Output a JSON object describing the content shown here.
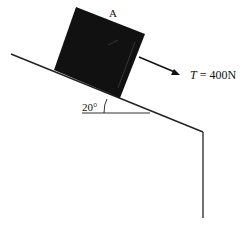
{
  "diagram": {
    "type": "inclined-plane-free-body",
    "block_label": "A",
    "angle_label": "20°",
    "force": {
      "symbol": "T",
      "equals": " = ",
      "value": "400N"
    },
    "colors": {
      "block": "#111111",
      "line": "#222222",
      "background": "#ffffff"
    }
  }
}
